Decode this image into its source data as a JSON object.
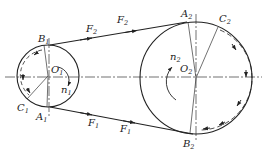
{
  "diagram": {
    "type": "belt-drive force diagram",
    "colors": {
      "stroke": "#222222",
      "background": "#ffffff"
    },
    "small_pulley": {
      "center_label": {
        "base": "O",
        "sub": "1"
      },
      "speed_label": {
        "base": "n",
        "sub": "1"
      },
      "points": [
        {
          "base": "B",
          "sub": "1"
        },
        {
          "base": "A",
          "sub": "1"
        },
        {
          "base": "C",
          "sub": "1"
        }
      ]
    },
    "large_pulley": {
      "center_label": {
        "base": "O",
        "sub": "2"
      },
      "speed_label": {
        "base": "n",
        "sub": "2"
      },
      "points": [
        {
          "base": "A",
          "sub": "2"
        },
        {
          "base": "B",
          "sub": "2"
        },
        {
          "base": "C",
          "sub": "2"
        }
      ]
    },
    "forces": {
      "tight_side": [
        {
          "base": "F",
          "sub": "2"
        },
        {
          "base": "F",
          "sub": "2"
        }
      ],
      "slack_side": [
        {
          "base": "F",
          "sub": "1"
        },
        {
          "base": "F",
          "sub": "1"
        }
      ]
    }
  }
}
